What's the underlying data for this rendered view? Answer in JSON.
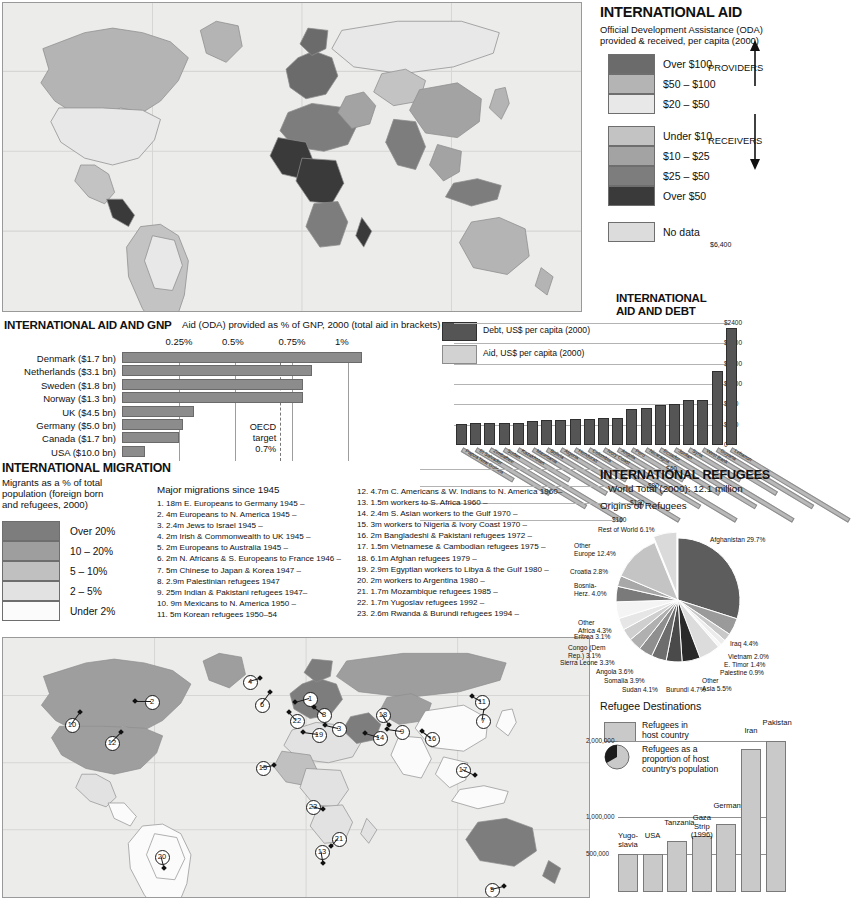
{
  "aid_section": {
    "title": "INTERNATIONAL AID",
    "subtitle_line1": "Official Development Assistance (ODA)",
    "subtitle_line2": "provided & received, per capita (2000)",
    "providers_label": "PROVIDERS",
    "receivers_label": "RECEIVERS",
    "legend": [
      {
        "label": "Over $100",
        "color": "#6b6b6b"
      },
      {
        "label": "$50 – $100",
        "color": "#b4b4b4"
      },
      {
        "label": "$20 – $50",
        "color": "#e8e8e8"
      },
      {
        "label": "Under $10",
        "color": "#c3c3c3"
      },
      {
        "label": "$10 – $25",
        "color": "#a3a3a3"
      },
      {
        "label": "$25 – $50",
        "color": "#7d7d7d"
      },
      {
        "label": "Over $50",
        "color": "#3a3a3a"
      },
      {
        "label": "No data",
        "color": "#dcdcdc"
      }
    ]
  },
  "aid_gnp": {
    "title": "INTERNATIONAL AID AND GNP",
    "subtitle": "Aid (ODA) provided as % of GNP, 2000 (total aid in brackets)",
    "oecd_note_l1": "OECD",
    "oecd_note_l2": "target",
    "oecd_note_l3": "0.7%",
    "chart_data": {
      "type": "bar",
      "title": "Aid (ODA) provided as % of GNP, 2000 (total aid in brackets)",
      "orientation": "horizontal",
      "categories": [
        "Denmark ($1.7 bn)",
        "Netherlands ($3.1 bn)",
        "Sweden ($1.8 bn)",
        "Norway ($1.3 bn)",
        "UK ($4.5 bn)",
        "Germany ($5.0 bn)",
        "Canada ($1.7 bn)",
        "USA ($10.0 bn)"
      ],
      "values": [
        1.06,
        0.84,
        0.8,
        0.8,
        0.32,
        0.27,
        0.25,
        0.1
      ],
      "tick_labels": [
        "0.25%",
        "0.5%",
        "0.75%",
        "1%"
      ],
      "ticks": [
        0.25,
        0.5,
        0.75,
        1.0
      ],
      "xlim": [
        0,
        1.15
      ],
      "ylabel": "",
      "xlabel": "% of GNP",
      "reference_line": {
        "value": 0.7,
        "label": "OECD target 0.7%"
      }
    }
  },
  "debt": {
    "title_l1": "INTERNATIONAL",
    "title_l2": "AID AND DEBT",
    "legend_debt": "Debt, US$ per capita (2000)",
    "legend_aid": "Aid, US$ per capita (2000)",
    "peak_label": "$6,400",
    "depth_ticks": [
      "$40",
      "$80",
      "$120",
      "$160"
    ],
    "chart_data": {
      "type": "bar",
      "title": "International aid and debt",
      "series": [
        {
          "name": "Debt, US$ per capita (2000)",
          "color": "#555555"
        },
        {
          "name": "Aid, US$ per capita (2000)",
          "color": "#d2d2d2"
        }
      ],
      "categories": [
        "Papua New Guinea",
        "El Salvador",
        "Zimbabwe",
        "Sudan",
        "Kazakhstan",
        "Mauritania",
        "Bolivia",
        "Algeria",
        "Honduras",
        "Colombia",
        "Ivory Coast",
        "Angola",
        "Peru",
        "Nicaragua",
        "Ecuador",
        "Jordan",
        "Syria",
        "West Bank",
        "Guyana",
        "Lebanon"
      ],
      "values": [
        410,
        430,
        430,
        440,
        440,
        470,
        490,
        500,
        510,
        520,
        530,
        540,
        700,
        730,
        780,
        800,
        880,
        890,
        1450,
        2300
      ],
      "ylabel": "US$ per capita",
      "peak_value": 6400
    }
  },
  "migration": {
    "title": "INTERNATIONAL MIGRATION",
    "subtitle_l1": "Migrants as a % of total",
    "subtitle_l2": "population (foreign born",
    "subtitle_l3": "and refugees, 2000)",
    "legend": [
      {
        "label": "Over 20%",
        "color": "#7d7d7d"
      },
      {
        "label": "10 – 20%",
        "color": "#9e9e9e"
      },
      {
        "label": "5 – 10%",
        "color": "#c0c0c0"
      },
      {
        "label": "2 – 5%",
        "color": "#e2e2e2"
      },
      {
        "label": "Under 2%",
        "color": "#fbfbfb"
      }
    ],
    "list_title": "Major migrations since 1945",
    "list_col1": [
      "1. 18m E. Europeans to Germany 1945 –",
      "2. 4m Europeans to N. America 1945 –",
      "3. 2.4m Jews to Israel 1945 –",
      "4. 2m Irish & Commonwealth to UK 1945 –",
      "5. 2m Europeans to Australia 1945 –",
      "6. 2m N. Africans & S. Europeans to France 1946 –",
      "7. 5m Chinese to Japan & Korea 1947 –",
      "8. 2.9m Palestinian refugees 1947",
      "9. 25m Indian & Pakistani refugees 1947–",
      "10. 9m Mexicans to N. America 1950 –",
      "11. 5m Korean refugees 1950–54"
    ],
    "list_col2": [
      "12. 4.7m C. Americans & W. Indians to N. America 1960–",
      "13. 1.5m workers to S. Africa 1960 –",
      "14. 2.4m S. Asian workers to the Gulf 1970 –",
      "15. 3m workers to Nigeria & Ivory Coast 1970 –",
      "16. 2m Bangladeshi & Pakistani refugees 1972 –",
      "17. 1.5m Vietnamese & Cambodian refugees 1975 –",
      "18. 6.1m Afghan refugees 1979 –",
      "19. 2.9m Egyptian workers to Libya & the Gulf 1980 –",
      "20. 2m workers to Argentina 1980 –",
      "21. 1.7m Mozambique refugees 1985 –",
      "22. 1.7m Yugoslav refugees 1992 –",
      "23. 2.6m Rwanda & Burundi refugees 1994 –"
    ],
    "markers": [
      {
        "n": "1",
        "x": 308,
        "y": 697,
        "dx": -14,
        "dy": 4
      },
      {
        "n": "2",
        "x": 150,
        "y": 700,
        "dx": -16,
        "dy": 0
      },
      {
        "n": "3",
        "x": 337,
        "y": 727,
        "dx": -13,
        "dy": -3
      },
      {
        "n": "4",
        "x": 248,
        "y": 680,
        "dx": 11,
        "dy": -3
      },
      {
        "n": "5",
        "x": 490,
        "y": 888,
        "dx": 13,
        "dy": -3
      },
      {
        "n": "6",
        "x": 260,
        "y": 703,
        "dx": 9,
        "dy": -12
      },
      {
        "n": "7",
        "x": 481,
        "y": 719,
        "dx": 2,
        "dy": -12
      },
      {
        "n": "8",
        "x": 322,
        "y": 713,
        "dx": -9,
        "dy": -7
      },
      {
        "n": "9",
        "x": 400,
        "y": 730,
        "dx": -14,
        "dy": -2
      },
      {
        "n": "10",
        "x": 70,
        "y": 723,
        "dx": 9,
        "dy": -12
      },
      {
        "n": "11",
        "x": 480,
        "y": 700,
        "dx": -9,
        "dy": -5
      },
      {
        "n": "12",
        "x": 110,
        "y": 741,
        "dx": 10,
        "dy": -10
      },
      {
        "n": "13",
        "x": 320,
        "y": 850,
        "dx": 2,
        "dy": 12
      },
      {
        "n": "14",
        "x": 378,
        "y": 736,
        "dx": -14,
        "dy": -4
      },
      {
        "n": "15",
        "x": 261,
        "y": 766,
        "dx": 12,
        "dy": -2
      },
      {
        "n": "16",
        "x": 430,
        "y": 737,
        "dx": -9,
        "dy": -7
      },
      {
        "n": "17",
        "x": 461,
        "y": 768,
        "dx": 13,
        "dy": 6
      },
      {
        "n": "18",
        "x": 381,
        "y": 713,
        "dx": 7,
        "dy": 11
      },
      {
        "n": "19",
        "x": 317,
        "y": 733,
        "dx": -15,
        "dy": -2
      },
      {
        "n": "20",
        "x": 160,
        "y": 855,
        "dx": 3,
        "dy": 12
      },
      {
        "n": "21",
        "x": 337,
        "y": 837,
        "dx": -7,
        "dy": 8
      },
      {
        "n": "22",
        "x": 295,
        "y": 719,
        "dx": -7,
        "dy": -8
      },
      {
        "n": "23",
        "x": 311,
        "y": 805,
        "dx": 11,
        "dy": 3
      }
    ]
  },
  "refugees": {
    "title": "INTERNATIONAL REFUGEES",
    "subtitle": "World Total (2000): 12.1 million",
    "origins_title": "Origins of Refugees",
    "chart_data": {
      "type": "pie",
      "title": "Origins of Refugees",
      "total": "12.1 million",
      "labels": [
        "Afghanistan",
        "Iraq",
        "Vietnam",
        "E. Timor",
        "Palestine",
        "Other Asia",
        "Burundi",
        "Sudan",
        "Somalia",
        "Angola",
        "Sierra Leone",
        "Congo (Dem Rep.)",
        "Eritrea",
        "Other Africa",
        "Bosnia-Herz.",
        "Croatia",
        "Other Europe",
        "Rest of World"
      ],
      "values": [
        29.7,
        4.4,
        2.0,
        1.4,
        0.9,
        5.5,
        4.7,
        4.1,
        3.9,
        3.6,
        3.3,
        3.1,
        3.1,
        4.3,
        4.0,
        2.8,
        12.4,
        6.1
      ],
      "display_labels": [
        "Afghanistan 29.7%",
        "Iraq 4.4%",
        "Vietnam 2.0%",
        "E. Timor 1.4%",
        "Palestine 0.9%",
        "Other Asia 5.5%",
        "Burundi 4.7%",
        "Sudan 4.1%",
        "Somalia 3.9%",
        "Angola 3.6%",
        "Sierra Leone 3.3%",
        "Congo (Dem Rep.) 3.1%",
        "Eritrea 3.1%",
        "Other Africa 4.3%",
        "Bosnia-Herz. 4.0%",
        "Croatia 2.8%",
        "Other Europe 12.4%",
        "Rest of World 6.1%"
      ],
      "unit": "%"
    },
    "dest_title": "Refugee Destinations",
    "dest_legend_1_l1": "Refugees in",
    "dest_legend_1_l2": "host country",
    "dest_legend_2_l1": "Refugees as a",
    "dest_legend_2_l2": "proportion of host",
    "dest_legend_2_l3": "country's population",
    "dest_chart": {
      "type": "bar",
      "title": "Refugee Destinations",
      "categories": [
        "Yugo-slavia",
        "USA",
        "Tanzania",
        "Gaza Strip (1996)",
        "Germany",
        "Iran",
        "Pakistan"
      ],
      "display_names": [
        "Yugo-\nslavia",
        "USA",
        "Tanzania",
        "Gaza\nStrip\n(1996)",
        "Germany",
        "Iran",
        "Pakistan"
      ],
      "values": [
        500000,
        510000,
        680000,
        740000,
        900000,
        1900000,
        2000000
      ],
      "tick_labels": [
        "500,000",
        "1,000,000",
        "2,000,000"
      ],
      "ticks": [
        500000,
        1000000,
        2000000
      ],
      "ylim": [
        0,
        2150000
      ],
      "ylabel": "Refugees in host country"
    }
  }
}
